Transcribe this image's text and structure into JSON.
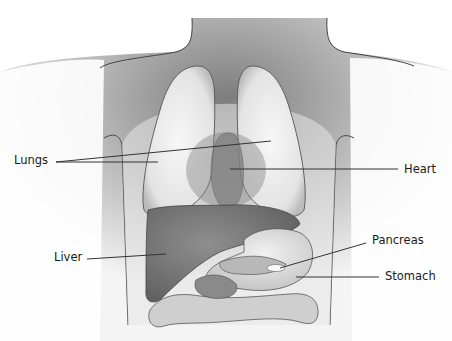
{
  "diagram": {
    "labels": [
      {
        "id": "lungs",
        "text": "Lungs",
        "x": 14,
        "y": 155
      },
      {
        "id": "heart",
        "text": "Heart",
        "x": 404,
        "y": 164
      },
      {
        "id": "liver",
        "text": "Liver",
        "x": 54,
        "y": 254
      },
      {
        "id": "pancreas",
        "text": "Pancreas",
        "x": 375,
        "y": 236
      },
      {
        "id": "stomach",
        "text": "Stomach",
        "x": 385,
        "y": 272
      }
    ],
    "colors": {
      "body_shade": "#8a8a8a",
      "lung": "#ececec",
      "heart": "#9a9a9a",
      "liver": "#7c7c7c",
      "stomach": "#dcdcdc",
      "leader_line": "#333333",
      "label_text": "#1a1a1a"
    }
  }
}
